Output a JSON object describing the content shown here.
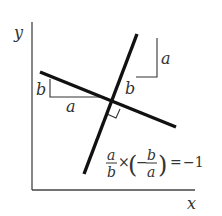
{
  "axes": {
    "x_label": "x",
    "y_label": "y"
  },
  "left_triangle": {
    "vertical_label": "b",
    "horizontal_label": "a"
  },
  "right_triangle": {
    "vertical_label": "a",
    "horizontal_label": "b"
  },
  "equation": {
    "frac1_num": "a",
    "frac1_den": "b",
    "times": "×",
    "open_paren": "(",
    "minus": "−",
    "frac2_num": "b",
    "frac2_den": "a",
    "close_paren": ")",
    "equals": "=",
    "result": "−1"
  },
  "colors": {
    "line": "#111111",
    "axis": "#444444",
    "text": "#333333"
  }
}
